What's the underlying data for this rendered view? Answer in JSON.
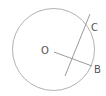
{
  "diagram": {
    "type": "circle-geometry",
    "stroke_color": "#9a9a9a",
    "label_color": "#555555",
    "circle": {
      "cx": 53.5,
      "cy": 49.5,
      "r": 41
    },
    "segment_OB": {
      "x1": 54,
      "y1": 52,
      "x2": 92,
      "y2": 66
    },
    "line_C": {
      "x1": 90,
      "y1": 14,
      "x2": 65,
      "y2": 76
    },
    "labels": {
      "O": {
        "text": "O",
        "x": 41,
        "y": 54
      },
      "B": {
        "text": "B",
        "x": 94,
        "y": 73
      },
      "C": {
        "text": "C",
        "x": 91,
        "y": 31
      }
    }
  }
}
